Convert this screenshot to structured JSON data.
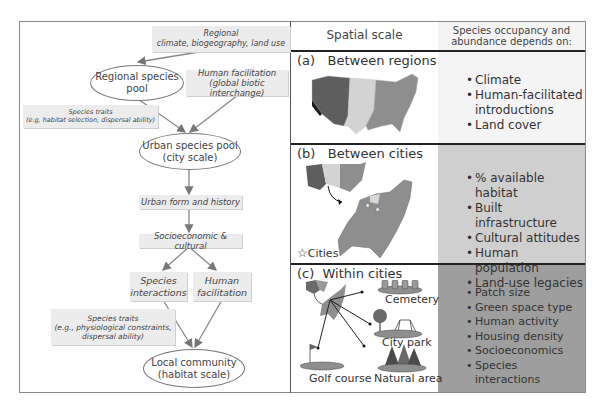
{
  "left_diagram": {
    "boxes": [
      {
        "id": "regional-drivers",
        "lines": [
          "Regional",
          "climate, biogeography, land use"
        ]
      },
      {
        "id": "human-facilitation-global",
        "lines": [
          "Human facilitation",
          "(global biotic interchange)"
        ]
      },
      {
        "id": "species-traits-regional",
        "lines": [
          "Species traits",
          "(e.g, habitat selection, dispersal ability)"
        ]
      },
      {
        "id": "urban-form",
        "lines": [
          "Urban form and history"
        ]
      },
      {
        "id": "socioeconomic",
        "lines": [
          "Socioeconomic & cultural"
        ]
      },
      {
        "id": "species-interactions",
        "lines": [
          "Species",
          "interactions"
        ]
      },
      {
        "id": "human-facilitation-local",
        "lines": [
          "Human",
          "facilitation"
        ]
      },
      {
        "id": "species-traits-local",
        "lines": [
          "Species traits",
          "(e.g., physiological constraints,",
          "dispersal ability)"
        ]
      }
    ],
    "ellipses": [
      {
        "id": "regional-pool",
        "lines": [
          "Regional species",
          "pool"
        ]
      },
      {
        "id": "urban-pool",
        "lines": [
          "Urban species pool",
          "(city scale)"
        ]
      },
      {
        "id": "local-community",
        "lines": [
          "Local community",
          "(habitat scale)"
        ]
      }
    ]
  },
  "right_table": {
    "headers": {
      "scale": "Spatial scale",
      "depends": [
        "Species occupancy and",
        "abundance depends on:"
      ]
    },
    "sections": [
      {
        "label": "(a)   Between regions",
        "bg": "#f4f4f4",
        "bullets": [
          "Climate",
          "Human-facilitated introductions",
          "Land cover"
        ]
      },
      {
        "label": "(b)   Between cities",
        "bg": "#cfcfcf",
        "legend": "Cities",
        "bullets": [
          "% available habitat",
          "Built infrastructure",
          "Cultural attitudes",
          "Human population",
          "Land-use legacies"
        ]
      },
      {
        "label": "(c)  Within cities",
        "bg": "#9e9e9e",
        "bullets": [
          "Patch size",
          "Green space type",
          "Human activity",
          "Housing density",
          "Socioeconomics",
          "Species interactions"
        ],
        "sites": [
          "Cemetery",
          "City park",
          "Golf course",
          "Natural area"
        ]
      }
    ]
  }
}
